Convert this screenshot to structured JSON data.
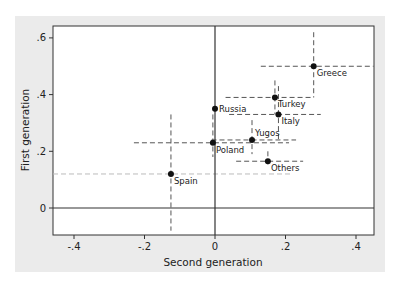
{
  "chart_data": {
    "type": "scatter",
    "title": "",
    "xlabel": "Second generation",
    "ylabel": "First generation",
    "xlim": [
      -0.47,
      0.45
    ],
    "ylim": [
      -0.095,
      0.645
    ],
    "xticks": [
      -0.4,
      -0.2,
      0,
      0.2,
      0.4
    ],
    "xtick_labels": [
      "-.4",
      "-.2",
      "0",
      ".2",
      ".4"
    ],
    "yticks": [
      0,
      0.2,
      0.4,
      0.6
    ],
    "ytick_labels": [
      "0",
      ".2",
      ".4",
      ".6"
    ],
    "grid": false,
    "reference_lines": {
      "x": 0,
      "y": 0
    },
    "points": [
      {
        "label": "Greece",
        "x": 0.28,
        "y": 0.5,
        "x_ci": [
          0.13,
          0.45
        ],
        "y_ci": [
          0.39,
          0.62
        ]
      },
      {
        "label": "Turkey",
        "x": 0.17,
        "y": 0.39,
        "x_ci": [
          0.03,
          0.28
        ],
        "y_ci": [
          0.33,
          0.45
        ]
      },
      {
        "label": "Russia",
        "x": 0.0,
        "y": 0.35,
        "x_ci": null,
        "y_ci": null
      },
      {
        "label": "Italy",
        "x": 0.18,
        "y": 0.33,
        "x_ci": [
          0.04,
          0.3
        ],
        "y_ci": [
          0.24,
          0.43
        ]
      },
      {
        "label": "Yugos",
        "x": 0.105,
        "y": 0.24,
        "x_ci": [
          -0.01,
          0.23
        ],
        "y_ci": [
          0.19,
          0.31
        ]
      },
      {
        "label": "Poland",
        "x": -0.006,
        "y": 0.23,
        "x_ci": [
          -0.23,
          0.21
        ],
        "y_ci": [
          0.18,
          0.33
        ]
      },
      {
        "label": "Others",
        "x": 0.15,
        "y": 0.165,
        "x_ci": [
          0.06,
          0.25
        ],
        "y_ci": [
          0.15,
          0.2
        ]
      },
      {
        "label": "Spain",
        "x": -0.125,
        "y": 0.12,
        "x_ci": [
          -0.47,
          0.22
        ],
        "y_ci": [
          -0.08,
          0.33
        ]
      }
    ],
    "colors": {
      "panel_bg": "#ebebeb",
      "plot_bg": "#ffffff",
      "point": "#111111",
      "ci_dark": "#555555",
      "ci_light": "#bbbbbb"
    }
  }
}
